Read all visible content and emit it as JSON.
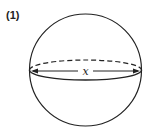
{
  "figure": {
    "label": "(1)",
    "shape": "sphere",
    "dimension_label": "x",
    "stroke_color": "#222222",
    "background": "#ffffff"
  }
}
